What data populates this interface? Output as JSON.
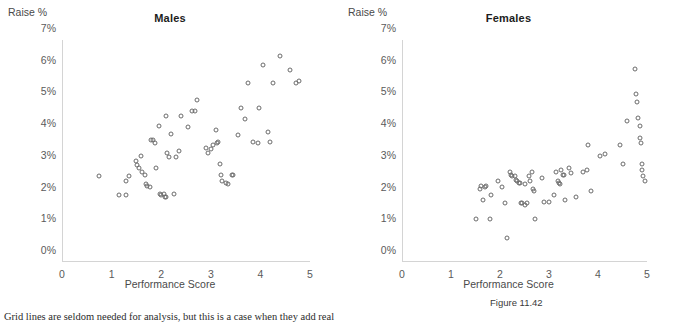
{
  "figure": {
    "label": "Figure 11.42",
    "caption": "Grid lines are seldom needed for analysis, but this is a case when they add real"
  },
  "axes": {
    "y_axis_title": "Raise %",
    "x_axis_title": "Performance Score",
    "y_ticks": [
      "0%",
      "1%",
      "2%",
      "3%",
      "4%",
      "5%",
      "6%",
      "7%"
    ],
    "x_ticks": [
      "0",
      "1",
      "2",
      "3",
      "4",
      "5"
    ]
  },
  "chart_data": [
    {
      "type": "scatter",
      "title": "Males",
      "xlabel": "Performance Score",
      "ylabel": "Raise %",
      "xlim": [
        0,
        5
      ],
      "ylim": [
        0,
        7
      ],
      "grid": false,
      "legend": "none",
      "marker": "open-circle",
      "points": [
        [
          0.75,
          2.7
        ],
        [
          1.15,
          2.1
        ],
        [
          1.3,
          2.1
        ],
        [
          1.3,
          2.55
        ],
        [
          1.35,
          2.7
        ],
        [
          1.5,
          3.2
        ],
        [
          1.52,
          3.05
        ],
        [
          1.55,
          2.95
        ],
        [
          1.6,
          3.35
        ],
        [
          1.62,
          2.85
        ],
        [
          1.68,
          2.75
        ],
        [
          1.7,
          2.45
        ],
        [
          1.72,
          2.4
        ],
        [
          1.78,
          2.35
        ],
        [
          1.8,
          3.85
        ],
        [
          1.84,
          3.85
        ],
        [
          1.88,
          3.75
        ],
        [
          1.9,
          2.95
        ],
        [
          1.95,
          4.3
        ],
        [
          1.98,
          2.15
        ],
        [
          2.0,
          2.1
        ],
        [
          2.05,
          2.15
        ],
        [
          2.08,
          2.05
        ],
        [
          2.1,
          2.05
        ],
        [
          2.1,
          4.6
        ],
        [
          2.12,
          3.45
        ],
        [
          2.15,
          3.3
        ],
        [
          2.2,
          4.05
        ],
        [
          2.25,
          2.15
        ],
        [
          2.3,
          3.3
        ],
        [
          2.35,
          3.5
        ],
        [
          2.4,
          4.6
        ],
        [
          2.55,
          4.25
        ],
        [
          2.62,
          4.75
        ],
        [
          2.68,
          4.75
        ],
        [
          2.72,
          5.1
        ],
        [
          2.9,
          3.6
        ],
        [
          2.95,
          3.45
        ],
        [
          3.0,
          3.55
        ],
        [
          3.05,
          3.7
        ],
        [
          3.1,
          4.15
        ],
        [
          3.12,
          3.75
        ],
        [
          3.15,
          3.8
        ],
        [
          3.18,
          3.1
        ],
        [
          3.2,
          2.75
        ],
        [
          3.22,
          2.55
        ],
        [
          3.3,
          2.5
        ],
        [
          3.35,
          2.45
        ],
        [
          3.42,
          2.75
        ],
        [
          3.45,
          2.75
        ],
        [
          3.55,
          4.0
        ],
        [
          3.6,
          4.85
        ],
        [
          3.68,
          4.5
        ],
        [
          3.75,
          5.65
        ],
        [
          3.85,
          3.8
        ],
        [
          3.95,
          3.75
        ],
        [
          3.98,
          4.85
        ],
        [
          4.05,
          6.2
        ],
        [
          4.15,
          4.1
        ],
        [
          4.2,
          3.8
        ],
        [
          4.25,
          5.65
        ],
        [
          4.4,
          6.5
        ],
        [
          4.6,
          6.05
        ],
        [
          4.72,
          5.65
        ],
        [
          4.78,
          5.7
        ]
      ]
    },
    {
      "type": "scatter",
      "title": "Females",
      "xlabel": "Performance Score",
      "ylabel": "Raise %",
      "xlim": [
        0,
        5
      ],
      "ylim": [
        0,
        7
      ],
      "grid": false,
      "legend": "none",
      "marker": "open-circle",
      "points": [
        [
          1.5,
          1.35
        ],
        [
          1.6,
          2.3
        ],
        [
          1.62,
          2.4
        ],
        [
          1.65,
          1.95
        ],
        [
          1.7,
          2.35
        ],
        [
          1.72,
          2.4
        ],
        [
          1.8,
          1.35
        ],
        [
          1.82,
          2.1
        ],
        [
          1.95,
          2.55
        ],
        [
          2.05,
          2.35
        ],
        [
          2.1,
          1.85
        ],
        [
          2.15,
          0.75
        ],
        [
          2.2,
          2.85
        ],
        [
          2.22,
          2.75
        ],
        [
          2.25,
          2.7
        ],
        [
          2.3,
          2.7
        ],
        [
          2.32,
          2.6
        ],
        [
          2.35,
          2.55
        ],
        [
          2.38,
          2.5
        ],
        [
          2.4,
          2.5
        ],
        [
          2.42,
          1.85
        ],
        [
          2.45,
          1.85
        ],
        [
          2.5,
          2.45
        ],
        [
          2.52,
          1.8
        ],
        [
          2.55,
          1.85
        ],
        [
          2.6,
          2.7
        ],
        [
          2.62,
          2.55
        ],
        [
          2.65,
          2.85
        ],
        [
          2.68,
          2.3
        ],
        [
          2.7,
          2.25
        ],
        [
          2.72,
          1.35
        ],
        [
          2.85,
          2.65
        ],
        [
          2.9,
          1.9
        ],
        [
          3.0,
          1.9
        ],
        [
          3.1,
          2.1
        ],
        [
          3.15,
          2.85
        ],
        [
          3.18,
          2.55
        ],
        [
          3.2,
          2.5
        ],
        [
          3.22,
          2.45
        ],
        [
          3.25,
          2.9
        ],
        [
          3.28,
          2.75
        ],
        [
          3.3,
          2.75
        ],
        [
          3.32,
          1.95
        ],
        [
          3.4,
          2.95
        ],
        [
          3.45,
          2.8
        ],
        [
          3.55,
          2.05
        ],
        [
          3.7,
          2.85
        ],
        [
          3.78,
          2.9
        ],
        [
          3.8,
          3.7
        ],
        [
          3.85,
          2.25
        ],
        [
          4.05,
          3.35
        ],
        [
          4.15,
          3.4
        ],
        [
          4.45,
          3.7
        ],
        [
          4.5,
          3.1
        ],
        [
          4.75,
          6.1
        ],
        [
          4.78,
          5.3
        ],
        [
          4.8,
          5.05
        ],
        [
          4.82,
          4.55
        ],
        [
          4.85,
          4.3
        ],
        [
          4.85,
          3.9
        ],
        [
          4.88,
          3.75
        ],
        [
          4.9,
          3.1
        ],
        [
          4.9,
          2.9
        ],
        [
          4.92,
          2.7
        ],
        [
          4.95,
          2.55
        ],
        [
          4.6,
          4.45
        ]
      ]
    }
  ]
}
